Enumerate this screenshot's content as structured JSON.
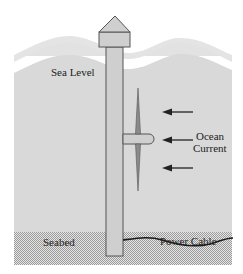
{
  "diagram": {
    "labels": {
      "sea_level": "Sea Level",
      "ocean_current_line1": "Ocean",
      "ocean_current_line2": "Current",
      "seabed": "Seabed",
      "power_cable": "Power Cable"
    },
    "colors": {
      "water": "#d9d9d9",
      "wave_band": "#e0e0e0",
      "structure": "#cfcfcf",
      "blade": "#8a8a8a",
      "outline": "#555555",
      "arrow": "#222222",
      "cable": "#1a1a1a",
      "seabed": "#c8c8c8"
    },
    "current_arrows": 3
  }
}
